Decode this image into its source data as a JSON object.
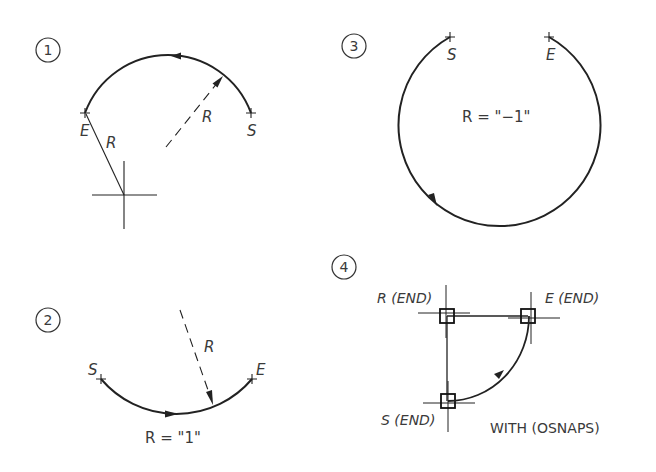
{
  "diagram": {
    "colors": {
      "line": "#222222",
      "text": "#3a3a3a",
      "background": "#ffffff"
    },
    "figures": [
      {
        "number": "1",
        "labels": {
          "start": "S",
          "end": "E",
          "radius_solid": "R",
          "radius_dashed": "R"
        }
      },
      {
        "number": "2",
        "labels": {
          "start": "S",
          "end": "E",
          "radius": "R",
          "equation": "R = \"1\""
        }
      },
      {
        "number": "3",
        "labels": {
          "start": "S",
          "end": "E",
          "equation": "R = \"−1\""
        }
      },
      {
        "number": "4",
        "labels": {
          "radius_point": "R (END)",
          "end_point": "E (END)",
          "start_point": "S (END)",
          "note": "WITH (OSNAPS)"
        }
      }
    ]
  }
}
